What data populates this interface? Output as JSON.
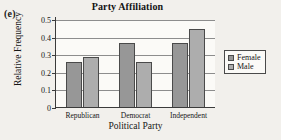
{
  "panel": {
    "label": "(e)"
  },
  "legend": {
    "position": "right",
    "entries": [
      {
        "label": "Female",
        "color": "#979797",
        "swatch_icon": "square-swatch-icon"
      },
      {
        "label": "Male",
        "color": "#adadad",
        "swatch_icon": "square-swatch-icon"
      }
    ]
  },
  "chart_data": {
    "type": "bar",
    "title": "Party Affiliation",
    "xlabel": "Political Party",
    "ylabel": "Relative Frequency",
    "categories": [
      "Republican",
      "Democrat",
      "Independent"
    ],
    "series": [
      {
        "name": "Female",
        "color": "#979797",
        "values": [
          0.26,
          0.37,
          0.37
        ]
      },
      {
        "name": "Male",
        "color": "#adadad",
        "values": [
          0.29,
          0.26,
          0.45
        ]
      }
    ],
    "ylim": [
      0,
      0.5
    ],
    "yticks": [
      0,
      0.1,
      0.2,
      0.3,
      0.4,
      0.5
    ],
    "ytick_labels": [
      "0",
      "0.1",
      "0.2",
      "0.3",
      "0.4",
      "0.5"
    ],
    "grid": true,
    "grid_axis": "y",
    "legend_position": "right"
  }
}
